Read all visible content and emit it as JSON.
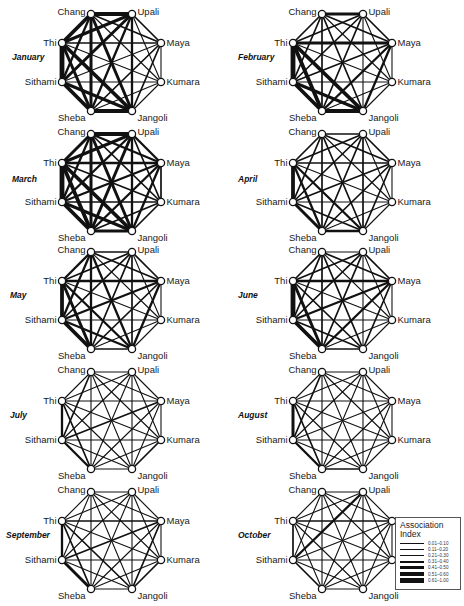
{
  "figure": {
    "nodes": [
      "Chang",
      "Upali",
      "Maya",
      "Kumara",
      "Jangoli",
      "Sheba",
      "Sithami",
      "Thi"
    ],
    "node_label_side": [
      "left",
      "right",
      "right",
      "right",
      "right",
      "left",
      "left",
      "left"
    ],
    "panels": [
      {
        "month": "January",
        "cx": 112,
        "cy": 62,
        "label_x": 12,
        "label_y": 60
      },
      {
        "month": "February",
        "cx": 343,
        "cy": 62,
        "label_x": 238,
        "label_y": 60
      },
      {
        "month": "March",
        "cx": 112,
        "cy": 182,
        "label_x": 12,
        "label_y": 182
      },
      {
        "month": "April",
        "cx": 343,
        "cy": 182,
        "label_x": 238,
        "label_y": 182
      },
      {
        "month": "May",
        "cx": 112,
        "cy": 300,
        "label_x": 10,
        "label_y": 298
      },
      {
        "month": "June",
        "cx": 343,
        "cy": 300,
        "label_x": 238,
        "label_y": 298
      },
      {
        "month": "July",
        "cx": 112,
        "cy": 420,
        "label_x": 10,
        "label_y": 418
      },
      {
        "month": "August",
        "cx": 343,
        "cy": 420,
        "label_x": 238,
        "label_y": 418
      },
      {
        "month": "September",
        "cx": 112,
        "cy": 540,
        "label_x": 6,
        "label_y": 538
      },
      {
        "month": "October",
        "cx": 343,
        "cy": 540,
        "label_x": 238,
        "label_y": 538
      }
    ]
  },
  "legend": {
    "title_line1": "Association",
    "title_line2": "Index",
    "items": [
      {
        "range": "0.01–0.10",
        "width": 0.6
      },
      {
        "range": "0.11–0.20",
        "width": 1.1
      },
      {
        "range": "0.21–0.30",
        "width": 1.7
      },
      {
        "range": "0.31–0.40",
        "width": 2.3
      },
      {
        "range": "0.41–0.50",
        "width": 3.0
      },
      {
        "range": "0.51–0.60",
        "width": 3.8
      },
      {
        "range": "0.61–1.00",
        "width": 4.8
      }
    ]
  },
  "chart_data": {
    "type": "network",
    "nodes": [
      "Chang",
      "Upali",
      "Maya",
      "Kumara",
      "Jangoli",
      "Sheba",
      "Sithami",
      "Thi"
    ],
    "edge_weight_scale": [
      "0.01–0.10",
      "0.11–0.20",
      "0.21–0.30",
      "0.31–0.40",
      "0.41–0.50",
      "0.51–0.60",
      "0.61–1.00"
    ],
    "edge_note": "Edge weights are category indices 1–7 (legend order) estimated visually; order of pairs: CU,CM,CK,CJ,CSb,CSi,CT,UM,UK,UJ,USb,USi,UT,MK,MJ,MSb,MSi,MT,KJ,KSb,KSi,KT,JSb,JSi,JT,SbSi,SbT,SiT",
    "months": {
      "January": [
        6,
        3,
        2,
        5,
        5,
        4,
        6,
        3,
        2,
        4,
        4,
        5,
        5,
        2,
        3,
        3,
        2,
        3,
        2,
        2,
        2,
        2,
        6,
        5,
        6,
        6,
        5,
        7
      ],
      "February": [
        5,
        3,
        2,
        3,
        3,
        3,
        3,
        3,
        2,
        2,
        3,
        3,
        3,
        2,
        4,
        4,
        3,
        5,
        2,
        2,
        2,
        2,
        6,
        5,
        6,
        6,
        6,
        7
      ],
      "March": [
        6,
        4,
        3,
        5,
        5,
        4,
        5,
        4,
        3,
        4,
        5,
        4,
        5,
        3,
        4,
        4,
        4,
        4,
        3,
        3,
        3,
        3,
        5,
        5,
        6,
        6,
        6,
        7
      ],
      "April": [
        3,
        3,
        2,
        3,
        3,
        3,
        3,
        3,
        2,
        3,
        3,
        3,
        3,
        2,
        3,
        3,
        3,
        3,
        2,
        2,
        2,
        2,
        4,
        3,
        4,
        5,
        4,
        6
      ],
      "May": [
        3,
        3,
        2,
        4,
        4,
        4,
        4,
        3,
        2,
        3,
        3,
        3,
        3,
        2,
        4,
        3,
        4,
        4,
        2,
        2,
        2,
        2,
        3,
        4,
        4,
        6,
        5,
        6
      ],
      "June": [
        2,
        3,
        2,
        3,
        3,
        3,
        3,
        3,
        2,
        2,
        3,
        3,
        3,
        2,
        3,
        4,
        4,
        4,
        2,
        2,
        2,
        2,
        3,
        3,
        3,
        6,
        5,
        7
      ],
      "July": [
        2,
        2,
        2,
        2,
        2,
        3,
        2,
        2,
        2,
        2,
        2,
        2,
        2,
        2,
        2,
        2,
        3,
        2,
        3,
        2,
        2,
        2,
        2,
        2,
        2,
        4,
        3,
        4
      ],
      "August": [
        2,
        2,
        2,
        2,
        2,
        3,
        2,
        2,
        2,
        2,
        2,
        2,
        2,
        2,
        2,
        2,
        2,
        2,
        2,
        2,
        2,
        2,
        3,
        2,
        2,
        4,
        3,
        5
      ],
      "September": [
        2,
        2,
        2,
        2,
        2,
        2,
        2,
        2,
        2,
        2,
        2,
        2,
        2,
        2,
        3,
        2,
        3,
        3,
        3,
        2,
        2,
        2,
        2,
        2,
        3,
        5,
        3,
        4
      ],
      "October": [
        2,
        2,
        2,
        2,
        2,
        2,
        2,
        2,
        2,
        2,
        2,
        4,
        2,
        2,
        2,
        2,
        2,
        3,
        2,
        2,
        2,
        2,
        2,
        2,
        2,
        3,
        2,
        3
      ]
    }
  }
}
